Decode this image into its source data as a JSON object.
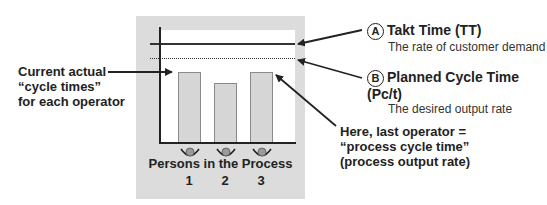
{
  "diagram": {
    "x_axis_label": "Persons in the Process",
    "persons": [
      {
        "number": "1",
        "bar_height_px": 71
      },
      {
        "number": "2",
        "bar_height_px": 60
      },
      {
        "number": "3",
        "bar_height_px": 71
      }
    ],
    "lines": {
      "takt_time": {
        "style": "solid"
      },
      "planned_cycle_time": {
        "style": "dotted"
      }
    }
  },
  "annotations": {
    "left": {
      "line1": "Current actual",
      "line2": "“cycle times”",
      "line3": "for each operator"
    },
    "a": {
      "marker": "A",
      "title": "Takt Time (TT)",
      "subtitle": "The rate of customer demand"
    },
    "b": {
      "marker": "B",
      "title": "Planned Cycle Time (Pc/t)",
      "subtitle": "The desired output rate"
    },
    "bottom_right": {
      "line1": "Here, last operator =",
      "line2": "“process cycle time”",
      "line3": "(process output rate)"
    }
  },
  "colors": {
    "panel": "#dcdcdc",
    "bar_fill": "#d6d6d6",
    "bar_stroke": "#8a8a8a",
    "ink": "#222222"
  }
}
